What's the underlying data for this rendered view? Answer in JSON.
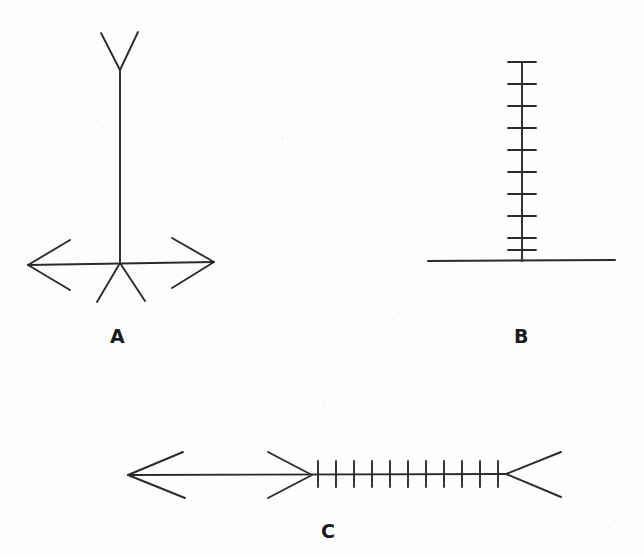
{
  "page": {
    "width": 644,
    "height": 557,
    "background_color": "#fefefe",
    "ink_color": "#2b2b2b",
    "stroke_width": 1.9,
    "caption_color": "#1a1a1a"
  },
  "labels": {
    "a": "A",
    "b": "B",
    "c": "C"
  },
  "chart_data": {
    "type": "diagram",
    "title": "",
    "figures": [
      {
        "id": "A",
        "label": "A",
        "label_position": [
          118,
          337
        ],
        "parts": [
          {
            "name": "vertical-shaft",
            "type": "polyline",
            "points": [
              [
                120,
                70
              ],
              [
                120,
                263
              ]
            ]
          },
          {
            "name": "top-fork-left-branch",
            "type": "polyline",
            "points": [
              [
                120,
                70
              ],
              [
                101,
                33
              ]
            ]
          },
          {
            "name": "top-fork-right-branch",
            "type": "polyline",
            "points": [
              [
                120,
                70
              ],
              [
                138,
                32
              ]
            ]
          },
          {
            "name": "horizontal-shaft",
            "type": "polyline",
            "points": [
              [
                28,
                265
              ],
              [
                214,
                262
              ]
            ]
          },
          {
            "name": "left-arrowhead",
            "type": "polyline",
            "points": [
              [
                70,
                240
              ],
              [
                28,
                265
              ],
              [
                70,
                290
              ]
            ]
          },
          {
            "name": "right-arrowhead",
            "type": "polyline",
            "points": [
              [
                172,
                238
              ],
              [
                214,
                262
              ],
              [
                172,
                288
              ]
            ]
          },
          {
            "name": "bottom-fork-left-leg",
            "type": "polyline",
            "points": [
              [
                120,
                263
              ],
              [
                97,
                302
              ]
            ]
          },
          {
            "name": "bottom-fork-right-leg",
            "type": "polyline",
            "points": [
              [
                120,
                263
              ],
              [
                145,
                301
              ]
            ]
          }
        ]
      },
      {
        "id": "B",
        "label": "B",
        "label_position": [
          522,
          337
        ],
        "parts": [
          {
            "name": "vertical-shaft",
            "type": "polyline",
            "points": [
              [
                522,
                62
              ],
              [
                522,
                261
              ]
            ]
          },
          {
            "name": "baseline",
            "type": "polyline",
            "points": [
              [
                428,
                261
              ],
              [
                615,
                260
              ]
            ]
          }
        ],
        "tick_orientation": "horizontal",
        "tick_count": 10,
        "tick_half_length": 14,
        "tick_positions_y": [
          62,
          84,
          106,
          128,
          150,
          172,
          194,
          216,
          238,
          250
        ]
      },
      {
        "id": "C",
        "label": "C",
        "label_position": [
          328,
          532
        ],
        "parts": [
          {
            "name": "main-shaft",
            "type": "polyline",
            "points": [
              [
                128,
                475
              ],
              [
                506,
                474
              ]
            ]
          },
          {
            "name": "left-arrowhead",
            "type": "polyline",
            "points": [
              [
                183,
                452
              ],
              [
                128,
                475
              ],
              [
                185,
                498
              ]
            ]
          },
          {
            "name": "middle-arrowhead",
            "type": "polyline",
            "points": [
              [
                268,
                452
              ],
              [
                312,
                475
              ],
              [
                268,
                498
              ]
            ]
          },
          {
            "name": "right-fletching",
            "type": "polyline",
            "points": [
              [
                561,
                452
              ],
              [
                506,
                474
              ],
              [
                561,
                497
              ]
            ]
          }
        ],
        "tick_orientation": "vertical",
        "tick_count": 11,
        "tick_half_length": 13,
        "tick_positions_x": [
          318,
          336,
          354,
          372,
          390,
          408,
          426,
          444,
          462,
          480,
          498
        ]
      }
    ]
  }
}
